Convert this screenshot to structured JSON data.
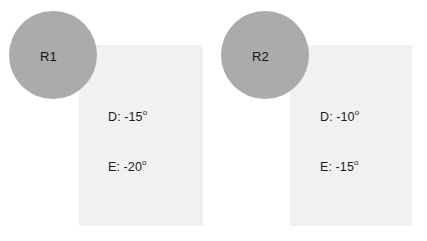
{
  "figure": {
    "background_color": "#ffffff",
    "width": 427,
    "height": 241
  },
  "style": {
    "circle_color": "#ababab",
    "panel_color": "#f1f1f1",
    "text_color": "#1b1b1b"
  },
  "groups": [
    {
      "id": "region-1",
      "circle": {
        "label": "R1",
        "cx": 53,
        "cy": 55,
        "r": 44,
        "color": "#ababab"
      },
      "panel": {
        "x": 79,
        "y": 45,
        "width": 124,
        "height": 181,
        "color": "#f1f1f1"
      },
      "measurements": [
        {
          "key": "D",
          "label": "D:",
          "value": "-15",
          "unit": "o",
          "text": "D: -15o"
        },
        {
          "key": "E",
          "label": "E:",
          "value": "-20",
          "unit": "o",
          "text": "E: -20o"
        }
      ]
    },
    {
      "id": "region-2",
      "circle": {
        "label": "R2",
        "cx": 265,
        "cy": 55,
        "r": 44,
        "color": "#ababab"
      },
      "panel": {
        "x": 290,
        "y": 45,
        "width": 122,
        "height": 181,
        "color": "#f1f1f1"
      },
      "measurements": [
        {
          "key": "D",
          "label": "D:",
          "value": "-10",
          "unit": "o",
          "text": "D: -10o"
        },
        {
          "key": "E",
          "label": "E:",
          "value": "-15",
          "unit": "o",
          "text": "E: -15o"
        }
      ]
    }
  ]
}
